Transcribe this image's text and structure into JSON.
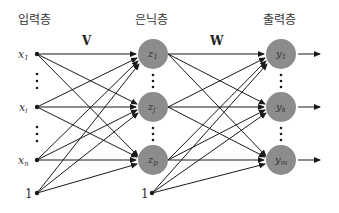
{
  "layers": {
    "input": {
      "title": "입력층"
    },
    "hidden": {
      "title": "은닉층"
    },
    "output": {
      "title": "출력층"
    }
  },
  "weights": {
    "input_to_hidden": "V",
    "hidden_to_output": "W"
  },
  "input_nodes": [
    {
      "var": "x",
      "sub": "1"
    },
    {
      "var": "x",
      "sub": "i"
    },
    {
      "var": "x",
      "sub": "n"
    }
  ],
  "input_bias": "1",
  "hidden_nodes": [
    {
      "var": "z",
      "sub": "1"
    },
    {
      "var": "z",
      "sub": "j"
    },
    {
      "var": "z",
      "sub": "p"
    }
  ],
  "hidden_bias": "1",
  "output_nodes": [
    {
      "var": "y",
      "sub": "1"
    },
    {
      "var": "y",
      "sub": "k"
    },
    {
      "var": "y",
      "sub": "m"
    }
  ],
  "colors": {
    "node_fill": "#8c8c8c",
    "edge": "#1a1a1a"
  }
}
